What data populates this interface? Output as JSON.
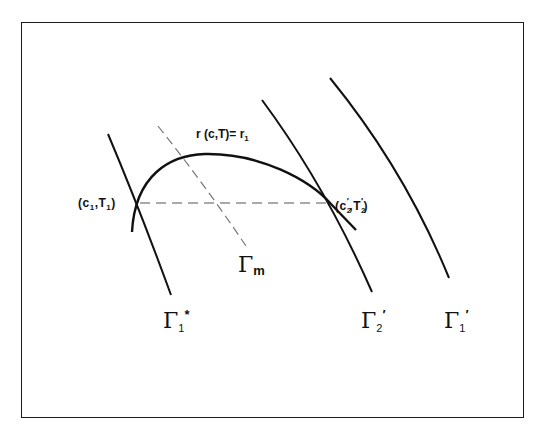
{
  "diagram": {
    "type": "phase-plane schematic",
    "colors": {
      "line": "#111111",
      "dashed": "#777777",
      "background": "#ffffff"
    },
    "curves": [
      {
        "id": "gamma-1-star",
        "style": "solid",
        "label": {
          "base": "Γ",
          "sub": "1",
          "sup": "*"
        }
      },
      {
        "id": "gamma-m",
        "style": "dashed",
        "label": {
          "base": "Γ",
          "sub": "m",
          "sup": ""
        }
      },
      {
        "id": "gamma-2-prime",
        "style": "solid",
        "label": {
          "base": "Γ",
          "sub": "2",
          "sup": "′"
        }
      },
      {
        "id": "gamma-1-prime",
        "style": "solid",
        "label": {
          "base": "Γ",
          "sub": "1",
          "sup": "′"
        }
      },
      {
        "id": "r-curve",
        "style": "solid",
        "label": {
          "text": "r (c,T)= r",
          "sub": "1"
        }
      }
    ],
    "points": [
      {
        "id": "point-1",
        "label": {
          "open": "(c",
          "sub1": "1",
          "mid": ",T",
          "sub2": "1",
          "close": ")"
        }
      },
      {
        "id": "point-2",
        "label": {
          "open": "(c",
          "sub1": "2",
          "sup1": "′",
          "mid": ",T",
          "sub2": "2",
          "sup2": "′",
          "close": ")"
        }
      }
    ],
    "connector": {
      "style": "dashed",
      "from": "point-1",
      "to": "point-2"
    }
  }
}
